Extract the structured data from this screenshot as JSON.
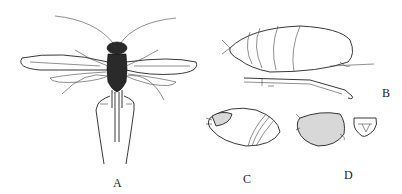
{
  "figure": {
    "panels": [
      {
        "id": "A",
        "label": "A",
        "description": "dorsal view of winged adult insect with long antennae and spread wings"
      },
      {
        "id": "B",
        "label": "B",
        "description": "lateral view of abdomen with ovipositor and hind leg"
      },
      {
        "id": "C",
        "label": "C",
        "description": "lateral view of rounded abdomen with banded segments"
      },
      {
        "id": "D",
        "label": "D",
        "description": "stippled abdomen with separate terminal plate detail"
      }
    ],
    "colors": {
      "background": "#ffffff",
      "ink": "#222222",
      "stipple": "#d8d8d8"
    }
  }
}
